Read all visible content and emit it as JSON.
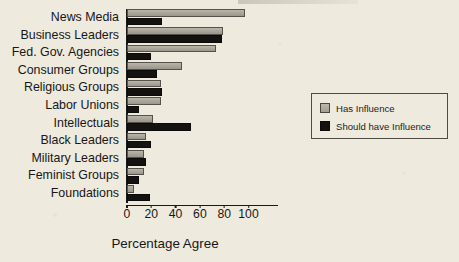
{
  "chart_data": {
    "type": "bar",
    "orientation": "horizontal",
    "title": "",
    "xlabel": "Percentage Agree",
    "ylabel": "",
    "xlim": [
      0,
      110
    ],
    "xticks": [
      0,
      20,
      40,
      60,
      80,
      100
    ],
    "xtick_labels": [
      "0",
      "20",
      "40",
      "60",
      "80",
      "100"
    ],
    "grid": false,
    "legend_position": "right",
    "categories": [
      "News Media",
      "Business Leaders",
      "Fed. Gov. Agencies",
      "Consumer Groups",
      "Religious Groups",
      "Labor Unions",
      "Intellectuals",
      "Black Leaders",
      "Military Leaders",
      "Feminist Groups",
      "Foundations"
    ],
    "series": [
      {
        "name": "Has Influence",
        "color": "#aba79d",
        "values": [
          97,
          79,
          73,
          45,
          28,
          28,
          21,
          16,
          14,
          14,
          6
        ]
      },
      {
        "name": "Should have Influence",
        "color": "#141210",
        "values": [
          29,
          78,
          20,
          25,
          29,
          10,
          53,
          20,
          16,
          10,
          19
        ]
      }
    ]
  },
  "legend": {
    "items": [
      {
        "label": "Has Influence",
        "swatch": "has"
      },
      {
        "label": "Should have Influence",
        "swatch": "should"
      }
    ]
  },
  "axis": {
    "x_title": "Percentage Agree"
  }
}
